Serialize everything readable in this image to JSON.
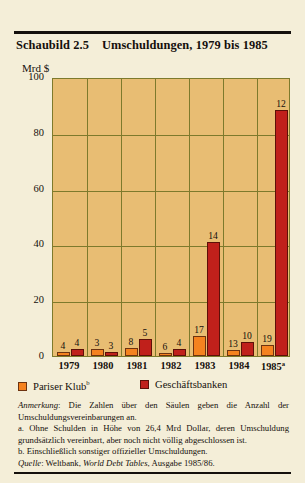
{
  "figure": {
    "label": "Schaubild 2.5",
    "title": "Umschuldungen, 1979 bis 1985",
    "unit": "Mrd $"
  },
  "legend": {
    "series1_label": "Pariser Klub",
    "series1_marker": "b",
    "series2_label": "Geschäftsbanken"
  },
  "notes": {
    "anmerkung_label": "Anmerkung",
    "anmerkung_text": ": Die Zahlen über den Säulen geben die Anzahl der Umschuldungsvereinbarungen an.",
    "note_a": "a. Ohne Schulden in Höhe von 26,4 Mrd Dollar, deren Umschuldung grundsätzlich vereinbart, aber noch nicht völlig abgeschlossen ist.",
    "note_b": "b. Einschließlich sonstiger offizieller Umschuldungen.",
    "quelle_label": "Quelle",
    "quelle_text_1": ": Weltbank, ",
    "quelle_italic": "World Debt Tables",
    "quelle_text_2": ", Ausgabe 1985/86."
  },
  "chart_data": {
    "type": "bar",
    "title": "Umschuldungen, 1979 bis 1985",
    "xlabel": "",
    "ylabel": "Mrd $",
    "ylim": [
      0,
      100
    ],
    "yticks": [
      0,
      20,
      40,
      60,
      80,
      100
    ],
    "grid": true,
    "legend_position": "below-plot",
    "categories": [
      "1979",
      "1980",
      "1981",
      "1982",
      "1983",
      "1984",
      "1985"
    ],
    "category_marks": [
      "",
      "",
      "",
      "",
      "",
      "",
      "a"
    ],
    "series": [
      {
        "name": "Pariser Klub",
        "color": "#f5821f",
        "values": [
          1.5,
          2.5,
          3.0,
          1.0,
          7.0,
          2.0,
          4.0
        ],
        "point_labels": [
          "4",
          "3",
          "8",
          "6",
          "17",
          "13",
          "19"
        ]
      },
      {
        "name": "Geschäftsbanken",
        "color": "#c0201b",
        "values": [
          2.5,
          1.5,
          6.0,
          2.5,
          41.0,
          5.0,
          88.0
        ],
        "point_labels": [
          "4",
          "3",
          "5",
          "4",
          "14",
          "10",
          "12"
        ]
      }
    ],
    "label_note": "Zahlen über den Säulen = Anzahl der Umschuldungsvereinbarungen"
  }
}
